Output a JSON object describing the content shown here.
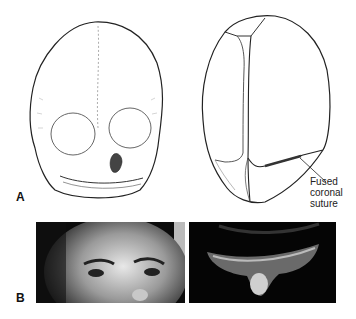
{
  "figure": {
    "panels": [
      {
        "label": "A",
        "content": "Line drawings of infant skull: frontal view and superior (vertex) view",
        "drawings": [
          {
            "name": "skull-frontal-view"
          },
          {
            "name": "skull-superior-view"
          }
        ],
        "annotation": {
          "lines": [
            "Fused",
            "coronal",
            "suture"
          ]
        }
      },
      {
        "label": "B",
        "content": "Clinical photographs: frontal face view and vertex view of child's head",
        "photos": [
          {
            "name": "photo-frontal-face"
          },
          {
            "name": "photo-vertex-view"
          }
        ]
      }
    ],
    "colors": {
      "ink": "#222222",
      "background": "#ffffff",
      "photo_bg": "#050505"
    }
  }
}
